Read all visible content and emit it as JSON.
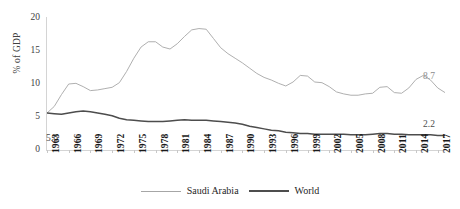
{
  "chart_data": {
    "type": "line",
    "title": "",
    "xlabel": "",
    "ylabel": "% of GDP",
    "ylim": [
      0,
      20
    ],
    "yticks": [
      0,
      5,
      10,
      15,
      20
    ],
    "xlim": [
      1963,
      2018
    ],
    "xticks": [
      1963,
      1966,
      1969,
      1972,
      1975,
      1978,
      1981,
      1984,
      1987,
      1990,
      1993,
      1996,
      1999,
      2002,
      2005,
      2008,
      2011,
      2014,
      2017
    ],
    "grid": false,
    "legend_position": "bottom",
    "annotations": [
      {
        "text": "5.6",
        "x": 1963,
        "y": 5.6,
        "placement": "below-left-start"
      },
      {
        "text": "8.7",
        "x": 2018,
        "y": 8.7,
        "placement": "right-end-saudi"
      },
      {
        "text": "2.2",
        "x": 2018,
        "y": 2.2,
        "placement": "right-end-world"
      }
    ],
    "x": [
      1963,
      1964,
      1965,
      1966,
      1967,
      1968,
      1969,
      1970,
      1971,
      1972,
      1973,
      1974,
      1975,
      1976,
      1977,
      1978,
      1979,
      1980,
      1981,
      1982,
      1983,
      1984,
      1985,
      1986,
      1987,
      1988,
      1989,
      1990,
      1991,
      1992,
      1993,
      1994,
      1995,
      1996,
      1997,
      1998,
      1999,
      2000,
      2001,
      2002,
      2003,
      2004,
      2005,
      2006,
      2007,
      2008,
      2009,
      2010,
      2011,
      2012,
      2013,
      2014,
      2015,
      2016,
      2017,
      2018
    ],
    "series": [
      {
        "name": "Saudi Arabia",
        "color": "#a6a6a6",
        "values": [
          5.6,
          6.6,
          8.4,
          10.0,
          10.1,
          9.6,
          9.0,
          9.1,
          9.3,
          9.5,
          10.2,
          11.9,
          13.9,
          15.6,
          16.4,
          16.4,
          15.6,
          15.3,
          16.1,
          17.2,
          18.2,
          18.4,
          18.3,
          16.9,
          15.5,
          14.6,
          13.9,
          13.2,
          12.4,
          11.6,
          11.0,
          10.6,
          10.1,
          9.7,
          10.3,
          11.3,
          11.2,
          10.3,
          10.2,
          9.6,
          8.8,
          8.5,
          8.3,
          8.3,
          8.5,
          8.6,
          9.5,
          9.6,
          8.7,
          8.6,
          9.4,
          10.7,
          11.3,
          10.6,
          9.4,
          8.7
        ]
      },
      {
        "name": "World",
        "color": "#4d4d4d",
        "values": [
          5.6,
          5.5,
          5.4,
          5.6,
          5.8,
          5.9,
          5.8,
          5.6,
          5.4,
          5.2,
          4.8,
          4.6,
          4.5,
          4.4,
          4.3,
          4.3,
          4.3,
          4.4,
          4.5,
          4.6,
          4.5,
          4.5,
          4.5,
          4.4,
          4.3,
          4.2,
          4.1,
          3.9,
          3.6,
          3.4,
          3.2,
          3.0,
          2.9,
          2.7,
          2.6,
          2.5,
          2.5,
          2.4,
          2.4,
          2.4,
          2.4,
          2.4,
          2.3,
          2.3,
          2.3,
          2.4,
          2.5,
          2.5,
          2.4,
          2.4,
          2.3,
          2.3,
          2.3,
          2.3,
          2.2,
          2.2
        ]
      }
    ]
  },
  "axis": {
    "y_title": "% of GDP",
    "y_tick_labels": [
      "20",
      "15",
      "10",
      "5",
      "0"
    ],
    "x_tick_labels": [
      "1963",
      "1966",
      "1969",
      "1972",
      "1975",
      "1978",
      "1981",
      "1984",
      "1987",
      "1990",
      "1993",
      "1996",
      "1999",
      "2002",
      "2005",
      "2008",
      "2011",
      "2014",
      "2017"
    ]
  },
  "labels": {
    "start_value": "5.6",
    "end_saudi": "8.7",
    "end_world": "2.2"
  },
  "legend": {
    "items": [
      {
        "label": "Saudi Arabia",
        "color": "#a6a6a6"
      },
      {
        "label": "World",
        "color": "#4d4d4d"
      }
    ]
  }
}
